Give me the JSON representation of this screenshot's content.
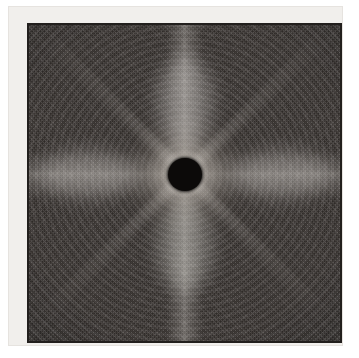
{
  "image": {
    "kind": "diffraction-pattern-photograph",
    "description": "Grayscale X-ray / electron diffraction pattern plate with a dark circular beamstop at the center and a bright radial halo fading into a speckled dark field",
    "symmetry": "four-fold with vertical and horizontal streaks",
    "beamstop": {
      "shape": "circle",
      "color": "#0c0a09"
    },
    "frame": {
      "outer_color": "#f1efec",
      "border_color": "#221f1d"
    },
    "field": {
      "background_color": "#3b3633",
      "halo_color": "#eeeae4",
      "vignette_color": "#000000"
    },
    "labels": {
      "title": "",
      "caption": "",
      "axis_labels": []
    }
  }
}
